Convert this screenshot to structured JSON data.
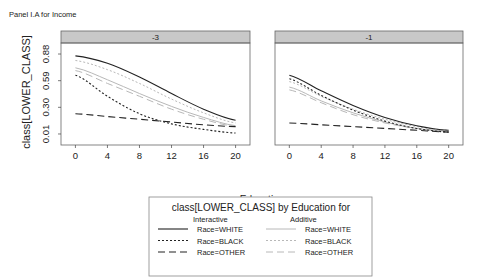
{
  "chart_data": {
    "type": "line",
    "title": "Panel I.A for Income",
    "xlabel": "Education",
    "ylabel": "class[LOWER_CLASS]",
    "x": [
      0,
      4,
      8,
      12,
      16,
      20
    ],
    "xticks": [
      "0",
      "4",
      "8",
      "12",
      "16",
      "20"
    ],
    "yticks": [
      "0.01",
      "0.30",
      "0.59",
      "0.88"
    ],
    "ytick_values": [
      0.01,
      0.3,
      0.59,
      0.88
    ],
    "ylim": [
      -0.11,
      1.0
    ],
    "xlim": [
      -1.8,
      21.8
    ],
    "grid": false,
    "legend_position": "bottom-center",
    "panels": [
      {
        "strip": "-3",
        "series": [
          {
            "name": "Race=WHITE",
            "model": "Interactive",
            "values": [
              0.86,
              0.78,
              0.63,
              0.45,
              0.28,
              0.16
            ]
          },
          {
            "name": "Race=BLACK",
            "model": "Interactive",
            "values": [
              0.65,
              0.42,
              0.23,
              0.12,
              0.06,
              0.02
            ]
          },
          {
            "name": "Race=OTHER",
            "model": "Interactive",
            "values": [
              0.23,
              0.2,
              0.17,
              0.14,
              0.11,
              0.09
            ]
          },
          {
            "name": "Race=WHITE",
            "model": "Additive",
            "values": [
              0.73,
              0.6,
              0.45,
              0.31,
              0.19,
              0.1
            ]
          },
          {
            "name": "Race=BLACK",
            "model": "Additive",
            "values": [
              0.81,
              0.71,
              0.56,
              0.39,
              0.24,
              0.13
            ]
          },
          {
            "name": "Race=OTHER",
            "model": "Additive",
            "values": [
              0.7,
              0.56,
              0.42,
              0.28,
              0.17,
              0.09
            ]
          }
        ]
      },
      {
        "strip": "-1",
        "series": [
          {
            "name": "Race=WHITE",
            "model": "Interactive",
            "values": [
              0.65,
              0.48,
              0.32,
              0.19,
              0.1,
              0.05
            ]
          },
          {
            "name": "Race=BLACK",
            "model": "Interactive",
            "values": [
              0.61,
              0.43,
              0.27,
              0.15,
              0.07,
              0.03
            ]
          },
          {
            "name": "Race=OTHER",
            "model": "Interactive",
            "values": [
              0.13,
              0.11,
              0.09,
              0.07,
              0.05,
              0.03
            ]
          },
          {
            "name": "Race=WHITE",
            "model": "Additive",
            "values": [
              0.52,
              0.37,
              0.24,
              0.14,
              0.07,
              0.04
            ]
          },
          {
            "name": "Race=BLACK",
            "model": "Additive",
            "values": [
              0.58,
              0.42,
              0.28,
              0.17,
              0.09,
              0.05
            ]
          },
          {
            "name": "Race=OTHER",
            "model": "Additive",
            "values": [
              0.49,
              0.35,
              0.22,
              0.13,
              0.07,
              0.04
            ]
          }
        ]
      }
    ],
    "legend": {
      "title": "class[LOWER_CLASS] by Education for",
      "columns": [
        "Interactive",
        "Additive"
      ],
      "entries": [
        "Race=WHITE",
        "Race=BLACK",
        "Race=OTHER"
      ]
    }
  },
  "styles": {
    "Interactive": {
      "color": "#222222"
    },
    "Additive": {
      "color": "#b8b8b8"
    },
    "strip_fill": "#c8c8c8",
    "dash": {
      "Race=WHITE": "",
      "Race=BLACK": "2,2",
      "Race=OTHER": "7,4"
    }
  }
}
